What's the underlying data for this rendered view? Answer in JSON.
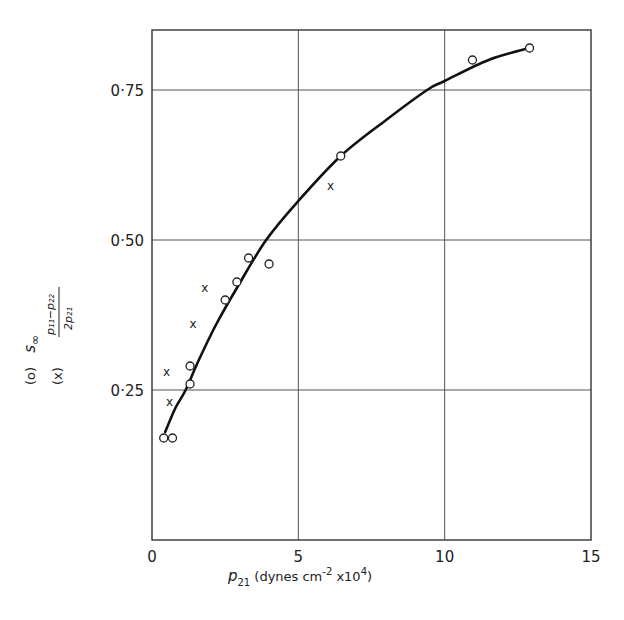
{
  "chart_data": {
    "type": "scatter",
    "title": "",
    "xlabel": "p21 (dynes cm^-2 x10^4)",
    "xlabel_parts": {
      "symbol": "p",
      "symbol_sub": "21",
      "units": " (dynes cm",
      "units_sup": "-2",
      "units_mid": " x10",
      "units_sup2": "4",
      "units_end": ")"
    },
    "ylabel": "(o) s∞ ; (x) (p11 - p22) / 2p21",
    "ylabel_parts": {
      "line1_marker": "(o)",
      "line1_symbol": "s",
      "line1_sub": "∞",
      "line2_marker": "(x)",
      "line2_numerator": "p₁₁−p₂₂",
      "line2_denominator": "2p₂₁"
    },
    "xlim": [
      0,
      15
    ],
    "ylim": [
      0,
      0.85
    ],
    "x_ticks": [
      0,
      5,
      10,
      15
    ],
    "x_tick_labels": [
      "0",
      "5",
      "10",
      "15"
    ],
    "y_ticks": [
      0.25,
      0.5,
      0.75
    ],
    "y_tick_labels": [
      "0·25",
      "0·50",
      "0·75"
    ],
    "grid": true,
    "legend": "none (markers explained in y-axis label)",
    "series": [
      {
        "name": "(o) s∞",
        "marker": "circle",
        "points": [
          [
            0.4,
            0.17
          ],
          [
            0.7,
            0.17
          ],
          [
            1.3,
            0.26
          ],
          [
            1.3,
            0.29
          ],
          [
            2.5,
            0.4
          ],
          [
            2.9,
            0.43
          ],
          [
            3.3,
            0.47
          ],
          [
            4.0,
            0.46
          ],
          [
            6.45,
            0.64
          ],
          [
            10.95,
            0.8
          ],
          [
            12.9,
            0.82
          ]
        ]
      },
      {
        "name": "(x) (p11 - p22)/2p21",
        "marker": "x",
        "points": [
          [
            0.6,
            0.23
          ],
          [
            0.5,
            0.28
          ],
          [
            1.4,
            0.36
          ],
          [
            1.8,
            0.42
          ],
          [
            6.1,
            0.59
          ]
        ]
      },
      {
        "name": "fitted curve",
        "marker": "line",
        "points": [
          [
            0.45,
            0.18
          ],
          [
            0.8,
            0.22
          ],
          [
            1.15,
            0.25
          ],
          [
            1.6,
            0.3
          ],
          [
            2.2,
            0.36
          ],
          [
            2.9,
            0.42
          ],
          [
            3.9,
            0.5
          ],
          [
            5.0,
            0.565
          ],
          [
            6.45,
            0.64
          ],
          [
            8.0,
            0.7
          ],
          [
            9.4,
            0.75
          ],
          [
            10.0,
            0.765
          ],
          [
            11.5,
            0.8
          ],
          [
            12.9,
            0.82
          ]
        ]
      }
    ]
  }
}
